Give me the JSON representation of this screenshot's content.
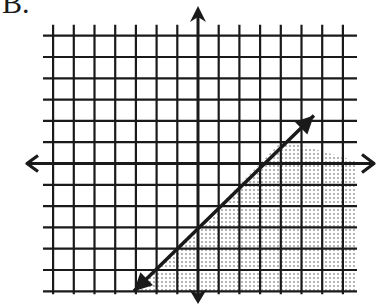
{
  "problem_label": "B.",
  "chart_data": {
    "type": "inequality-graph",
    "title": "B.",
    "grid": {
      "x_min": -7,
      "x_max": 7,
      "y_min": -6,
      "y_max": 6,
      "step": 1,
      "gridlines": true,
      "axis_arrows": true,
      "axis_labels": false,
      "tick_labels": false
    },
    "boundary_line": {
      "equation": "y = x - 3",
      "slope": 1,
      "y_intercept": -3,
      "style": "solid",
      "arrows_both_ends": true,
      "from": [
        -3.1,
        -6
      ],
      "to": [
        5.6,
        2.25
      ]
    },
    "inequality": "y <= x - 3",
    "shaded_region": "below-right of line",
    "shading_pattern": "dotted"
  },
  "colors": {
    "ink": "#1a1a1a",
    "shade_dot": "#555555",
    "background": "#ffffff"
  }
}
